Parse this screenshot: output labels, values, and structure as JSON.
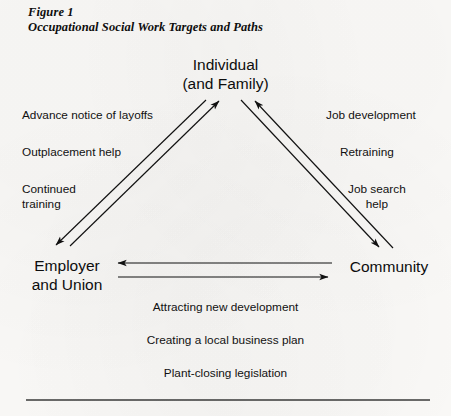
{
  "figure": {
    "caption_line1": "Figure 1",
    "caption_line2": "Occupational Social Work Targets and Paths",
    "ink_color": "#111111",
    "paper_color": "#fbfaf8"
  },
  "nodes": {
    "individual": {
      "line1": "Individual",
      "line2": "(and Family)"
    },
    "employer": {
      "line1": "Employer",
      "line2": "and Union"
    },
    "community": {
      "line1": "Community"
    }
  },
  "left_labels": {
    "advance_notice": "Advance notice of layoffs",
    "outplacement": "Outplacement help",
    "continued_line1": "Continued",
    "continued_line2": "training"
  },
  "right_labels": {
    "job_development": "Job development",
    "retraining": "Retraining",
    "job_search_line1": "Job search",
    "job_search_line2": "help"
  },
  "bottom_labels": {
    "attracting": "Attracting new development",
    "creating": "Creating a local business plan",
    "plant_closing": "Plant-closing legislation"
  },
  "diagram_data": {
    "type": "triangle-relationship-diagram",
    "node_ids": [
      "individual",
      "employer",
      "community"
    ],
    "edges": [
      {
        "id": "employer-to-individual",
        "from": "employer",
        "to": "individual",
        "direction": "up-right",
        "labels": [
          "Advance notice of layoffs",
          "Outplacement help",
          "Continued training"
        ]
      },
      {
        "id": "individual-to-employer",
        "from": "individual",
        "to": "employer",
        "direction": "down-left",
        "labels": []
      },
      {
        "id": "community-to-individual",
        "from": "community",
        "to": "individual",
        "direction": "up-left",
        "labels": [
          "Job development",
          "Retraining",
          "Job search help"
        ]
      },
      {
        "id": "individual-to-community",
        "from": "individual",
        "to": "community",
        "direction": "down-right",
        "labels": []
      },
      {
        "id": "community-to-employer",
        "from": "community",
        "to": "employer",
        "direction": "left",
        "labels": []
      },
      {
        "id": "employer-to-community",
        "from": "employer",
        "to": "community",
        "direction": "right",
        "labels": [
          "Attracting new development",
          "Creating a local business plan",
          "Plant-closing legislation"
        ]
      }
    ]
  }
}
